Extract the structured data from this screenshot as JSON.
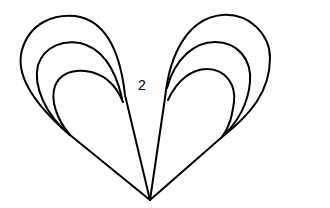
{
  "diagram": {
    "type": "line-drawing",
    "label": "2",
    "colors": {
      "stroke": "#000000",
      "background": "#ffffff"
    },
    "left_side": {
      "loops": [
        "outer",
        "middle",
        "inner"
      ]
    },
    "right_side": {
      "loops": [
        "outer",
        "middle",
        "inner"
      ]
    },
    "apex": {
      "x": 150,
      "y": 200
    }
  }
}
